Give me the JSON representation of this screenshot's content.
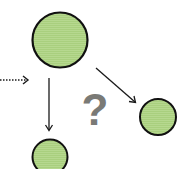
{
  "diagram": {
    "colors": {
      "node_fill": "#a9cf7e",
      "node_stroke": "#111111",
      "arrow": "#1a1a1a",
      "question": "#7a7a76"
    },
    "nodes": [
      {
        "id": "top-node",
        "cx": 60,
        "cy": 40,
        "r": 28
      },
      {
        "id": "right-node",
        "cx": 158,
        "cy": 117,
        "r": 18
      },
      {
        "id": "bottom-node",
        "cx": 50,
        "cy": 157,
        "r": 18
      }
    ],
    "edges": [
      {
        "id": "incoming-dotted",
        "style": "dotted",
        "from": [
          0,
          80
        ],
        "to": [
          28,
          80
        ]
      },
      {
        "id": "top-to-bottom",
        "style": "solid",
        "from": [
          49,
          78
        ],
        "to": [
          49,
          130
        ]
      },
      {
        "id": "top-to-right",
        "style": "solid",
        "from": [
          96,
          68
        ],
        "to": [
          135,
          102
        ]
      }
    ],
    "question_label": "?"
  }
}
